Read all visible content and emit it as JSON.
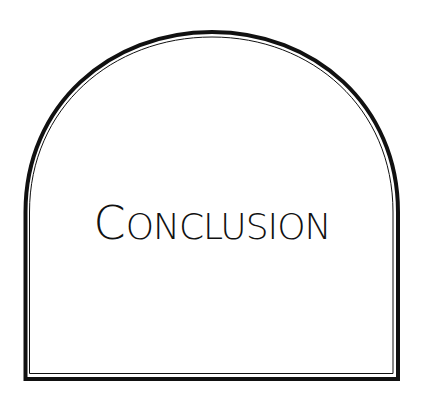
{
  "page": {
    "title_initial": "C",
    "title_rest": "ONCLUSION",
    "title_full": "CONCLUSION"
  },
  "colors": {
    "background": "#ffffff",
    "frame": "#111111",
    "text": "#111111"
  }
}
